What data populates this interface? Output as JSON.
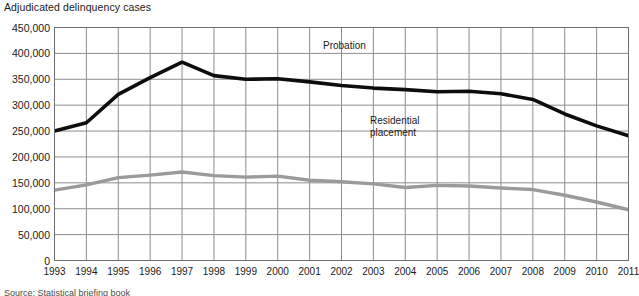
{
  "chart_data": {
    "type": "line",
    "title": "Adjudicated delinquency cases",
    "xlabel": "",
    "ylabel": "",
    "grid": true,
    "legend_position": "inline-annotation",
    "xlim": [
      1993,
      2011
    ],
    "ylim": [
      0,
      450000
    ],
    "ytick_labels": [
      "450,000",
      "400,000",
      "350,000",
      "300,000",
      "250,000",
      "200,000",
      "150,000",
      "100,000",
      "50,000",
      "0"
    ],
    "ytick_values": [
      450000,
      400000,
      350000,
      300000,
      250000,
      200000,
      150000,
      100000,
      50000,
      0
    ],
    "categories": [
      1993,
      1994,
      1995,
      1996,
      1997,
      1998,
      1999,
      2000,
      2001,
      2002,
      2003,
      2004,
      2005,
      2006,
      2007,
      2008,
      2009,
      2010,
      2011
    ],
    "xtick_labels": [
      "1993",
      "1994",
      "1995",
      "1996",
      "1997",
      "1998",
      "1999",
      "2000",
      "2001",
      "2002",
      "2003",
      "2004",
      "2005",
      "2006",
      "2007",
      "2008",
      "2009",
      "2010",
      "2011"
    ],
    "series": [
      {
        "name": "Probation",
        "color": "#0d0d0d",
        "values": [
          250000,
          266000,
          321000,
          353000,
          383000,
          357000,
          350000,
          351000,
          345000,
          338000,
          333000,
          330000,
          326000,
          327000,
          322000,
          311000,
          283000,
          260000,
          241000
        ]
      },
      {
        "name": "Residential placement",
        "color": "#9a9a9a",
        "values": [
          136000,
          146000,
          160000,
          165000,
          171000,
          164000,
          161000,
          163000,
          155000,
          152000,
          148000,
          141000,
          145000,
          144000,
          140000,
          137000,
          126000,
          113000,
          98000
        ]
      }
    ],
    "annotations": [
      {
        "id": "probation",
        "text": "Probation"
      },
      {
        "id": "residential",
        "text": "Residential\nplacement",
        "line1": "Residential",
        "line2": "placement"
      }
    ]
  },
  "source": {
    "note": "Source:  Statistical briefing book"
  }
}
